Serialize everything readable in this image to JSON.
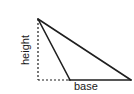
{
  "diagram": {
    "name": "triangle-base-height-diagram",
    "type": "geometry-figure",
    "background_color": "#ffffff",
    "stroke_color": "#1f1f1f",
    "labels": {
      "height": "height",
      "base": "base"
    },
    "geometry": {
      "apex": {
        "x": 38,
        "y": 19
      },
      "foot": {
        "x": 70,
        "y": 80
      },
      "right_vertex": {
        "x": 131,
        "y": 80
      },
      "dashed_corner": {
        "x": 38,
        "y": 80
      },
      "solid_stroke_width": 1.6,
      "dashed_stroke_width": 1.2,
      "dash_pattern": "2,2"
    }
  }
}
